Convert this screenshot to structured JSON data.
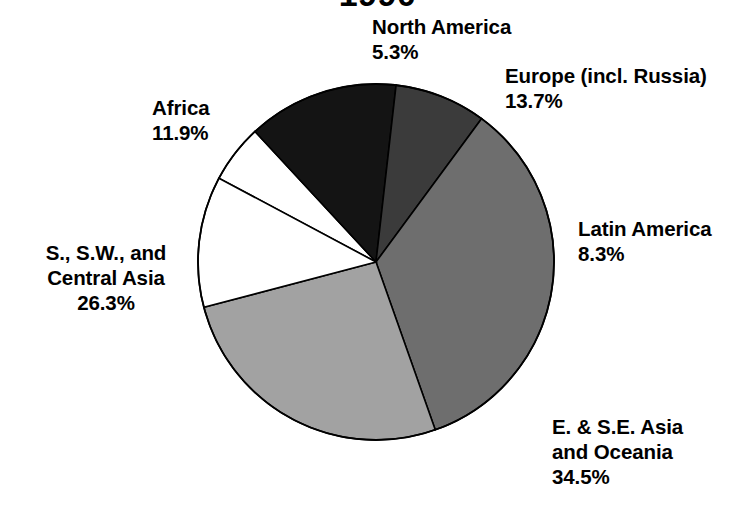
{
  "chart_data": {
    "type": "pie",
    "title": "1990",
    "xlabel": "",
    "ylabel": "",
    "legend_position": "none",
    "grid": false,
    "units": "percent",
    "start_angle_deg": 0,
    "direction": "clockwise",
    "categories": [
      "North America",
      "Europe (incl. Russia)",
      "Latin America",
      "E. & S.E. Asia and Oceania",
      "S., S.W., and Central Asia",
      "Africa"
    ],
    "values": [
      5.3,
      13.7,
      8.3,
      34.5,
      26.3,
      11.9
    ],
    "slices": [
      {
        "name": "North America",
        "label": "North America",
        "value": 5.3,
        "value_text": "5.3%",
        "color": "#ffffff",
        "start_deg": 341.3,
        "sweep_deg": 19.08
      },
      {
        "name": "Europe (incl. Russia)",
        "label": "Europe (incl. Russia)",
        "value": 13.7,
        "value_text": "13.7%",
        "color": "#141414",
        "start_deg": 0.4,
        "sweep_deg": 49.32
      },
      {
        "name": "Latin America",
        "label": "Latin America",
        "value": 8.3,
        "value_text": "8.3%",
        "color": "#3b3b3b",
        "start_deg": 49.72,
        "sweep_deg": 29.88
      },
      {
        "name": "E. & S.E. Asia and Oceania",
        "label_line1": "E. & S.E. Asia",
        "label_line2": "and Oceania",
        "value": 34.5,
        "value_text": "34.5%",
        "color": "#6e6e6e",
        "start_deg": 79.6,
        "sweep_deg": 124.2
      },
      {
        "name": "S., S.W., and Central Asia",
        "label_line1": "S., S.W., and",
        "label_line2": "Central Asia",
        "value": 26.3,
        "value_text": "26.3%",
        "color": "#a2a2a2",
        "start_deg": 203.8,
        "sweep_deg": 94.68
      },
      {
        "name": "Africa",
        "label": "Africa",
        "value": 11.9,
        "value_text": "11.9%",
        "color": "#ffffff",
        "start_deg": 298.48,
        "sweep_deg": 42.84
      }
    ],
    "outline_color": "#000000"
  },
  "labels": {
    "north_america": {
      "name": "North America",
      "pct": "5.3%"
    },
    "europe": {
      "name": "Europe (incl. Russia)",
      "pct": "13.7%"
    },
    "latin_america": {
      "name": "Latin America",
      "pct": "8.3%"
    },
    "east_southeast_asia": {
      "line1": "E. & S.E. Asia",
      "line2": "and Oceania",
      "pct": "34.5%"
    },
    "south_southwest_central_asia": {
      "line1": "S., S.W., and",
      "line2": "Central Asia",
      "pct": "26.3%"
    },
    "africa": {
      "name": "Africa",
      "pct": "11.9%"
    }
  }
}
